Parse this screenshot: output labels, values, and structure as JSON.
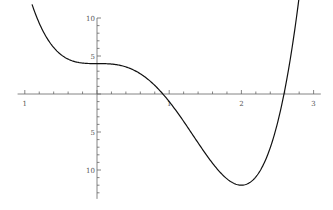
{
  "chart_data": {
    "type": "line",
    "title": "",
    "xlabel": "",
    "ylabel": "",
    "function": "f(x) = 3x^4 - 8x^3 + 4",
    "xlim": [
      -1.1,
      3.1
    ],
    "ylim": [
      -13.8,
      10
    ],
    "grid": false,
    "legend": null,
    "x_ticks": [
      {
        "value": -1,
        "label": "1"
      },
      {
        "value": 1,
        "label": "1"
      },
      {
        "value": 2,
        "label": "2"
      },
      {
        "value": 3,
        "label": "3"
      }
    ],
    "y_ticks": [
      {
        "value": 10,
        "label": "10"
      },
      {
        "value": 5,
        "label": "5"
      },
      {
        "value": -5,
        "label": "5"
      },
      {
        "value": -10,
        "label": "10"
      }
    ],
    "x_minor_step": 0.2,
    "y_minor_step": 1,
    "series": [
      {
        "name": "f(x)",
        "x": [
          -0.9,
          -0.8,
          -0.6,
          -0.4,
          -0.2,
          0,
          0.2,
          0.4,
          0.6,
          0.8,
          1.0,
          1.2,
          1.4,
          1.6,
          1.8,
          2.0,
          2.2,
          2.4,
          2.6,
          2.8
        ],
        "values": [
          11.8,
          9.3,
          6.1,
          4.6,
          4.07,
          4.0,
          3.94,
          3.56,
          2.66,
          1.13,
          -1.0,
          -3.6,
          -6.42,
          -9.1,
          -11.16,
          -12.0,
          -10.84,
          -6.88,
          0.5,
          12.8
        ]
      }
    ]
  }
}
